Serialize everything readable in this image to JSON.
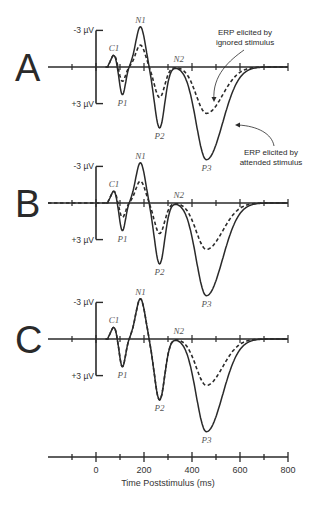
{
  "chart_data": {
    "type": "line",
    "title": "",
    "xlabel": "Time Poststimulus (ms)",
    "ylabel": "µV (negative up)",
    "xlim": [
      -100,
      800
    ],
    "x_ticks": [
      -100,
      0,
      100,
      200,
      300,
      400,
      500,
      600,
      700,
      800
    ],
    "x_tick_labels": [
      "0",
      "200",
      "400",
      "600",
      "800"
    ],
    "x_tick_label_values": [
      0,
      200,
      400,
      600,
      800
    ],
    "y_scale_labels": {
      "top": "-3 µV",
      "bottom": "+3 µV"
    },
    "y_inverted": true,
    "components": [
      {
        "name": "C1",
        "latency_ms": 75,
        "polarity": "negative"
      },
      {
        "name": "P1",
        "latency_ms": 110,
        "polarity": "positive"
      },
      {
        "name": "N1",
        "latency_ms": 185,
        "polarity": "negative"
      },
      {
        "name": "P2",
        "latency_ms": 265,
        "polarity": "positive"
      },
      {
        "name": "N2",
        "latency_ms": 345,
        "polarity": "negative"
      },
      {
        "name": "P3",
        "latency_ms": 460,
        "polarity": "positive"
      }
    ],
    "panels": [
      {
        "label": "A",
        "series": [
          {
            "name": "ERP elicited by attended stimulus",
            "style": "solid",
            "peaks_uV": {
              "C1": -1.0,
              "P1": 2.3,
              "N1": -3.3,
              "P2": 5.0,
              "N2": 0.0,
              "P3": 7.6
            }
          },
          {
            "name": "ERP elicited by ignored stimulus",
            "style": "dashed",
            "peaks_uV": {
              "C1": -1.0,
              "P1": 1.2,
              "N1": -1.8,
              "P2": 2.5,
              "N2": 0.0,
              "P3": 3.8
            }
          }
        ]
      },
      {
        "label": "B",
        "series": [
          {
            "name": "ERP elicited by attended stimulus",
            "style": "solid",
            "peaks_uV": {
              "C1": -1.0,
              "P1": 2.3,
              "N1": -3.3,
              "P2": 5.0,
              "N2": 0.0,
              "P3": 7.6
            }
          },
          {
            "name": "ERP elicited by ignored stimulus",
            "style": "dashed",
            "peaks_uV": {
              "C1": -1.0,
              "P1": 1.2,
              "N1": -1.8,
              "P2": 2.5,
              "N2": 0.0,
              "P3": 3.8
            }
          }
        ]
      },
      {
        "label": "C",
        "series": [
          {
            "name": "ERP elicited by attended stimulus",
            "style": "solid",
            "peaks_uV": {
              "C1": -1.0,
              "P1": 2.3,
              "N1": -3.3,
              "P2": 5.0,
              "N2": 0.0,
              "P3": 7.6
            }
          },
          {
            "name": "ERP elicited by ignored stimulus",
            "style": "dashed",
            "peaks_uV": {
              "C1": -1.0,
              "P1": 2.3,
              "N1": -3.3,
              "P2": 5.0,
              "N2": 0.0,
              "P3": 3.8
            }
          }
        ]
      }
    ],
    "annotations": [
      {
        "text": "ERP elicited by ignored stimulus",
        "panel": "A",
        "points_to": "dashed"
      },
      {
        "text": "ERP elicited by attended stimulus",
        "panel": "A",
        "points_to": "solid"
      }
    ],
    "grid": false,
    "legend": "none"
  },
  "panels": [
    {
      "label": "A",
      "baseline_y": 67,
      "ymin_label": "-3 µV",
      "ymax_label": "+3 µV"
    },
    {
      "label": "B",
      "baseline_y": 203,
      "ymin_label": "-3 µV",
      "ymax_label": "+3 µV"
    },
    {
      "label": "C",
      "baseline_y": 339,
      "ymin_label": "-3 µV",
      "ymax_label": "+3 µV"
    }
  ],
  "annotations": {
    "ignored_line1": "ERP elicited by",
    "ignored_line2": "ignored stimulus",
    "attended_line1": "ERP elicited by",
    "attended_line2": "attended stimulus"
  },
  "time_axis": {
    "title": "Time Poststimulus (ms)",
    "labels": [
      "0",
      "200",
      "400",
      "600",
      "800"
    ]
  },
  "colors": {
    "ink": "#2a2a2a",
    "label": "#555555",
    "background": "#ffffff"
  }
}
